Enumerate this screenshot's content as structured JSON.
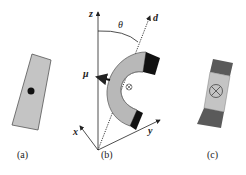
{
  "figure": {
    "panels": [
      {
        "id": "a",
        "label": "(a)"
      },
      {
        "id": "b",
        "label": "(b)"
      },
      {
        "id": "c",
        "label": "(c)"
      }
    ],
    "axes": {
      "z": "z",
      "x": "x",
      "y": "y",
      "d": "d"
    },
    "angle": "θ",
    "moment": "μ",
    "colors": {
      "magnet_body": "#b8b8b8",
      "magnet_pole": "#111111",
      "pole_dark_gray": "#555555",
      "line": "#222222"
    }
  }
}
